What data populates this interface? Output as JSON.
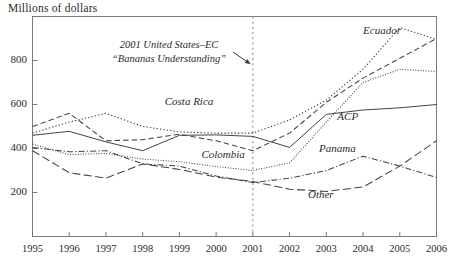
{
  "chart_data": {
    "type": "line",
    "title": "",
    "subtitle": "",
    "ylabel": "Millions of dollars",
    "xlabel": "",
    "grid": false,
    "legend_position": "inline-labels",
    "x": [
      1995,
      1996,
      1997,
      1998,
      1999,
      2000,
      2001,
      2002,
      2003,
      2004,
      2005,
      2006
    ],
    "xtick_labels": [
      "1995",
      "1996",
      "1997",
      "1998",
      "1999",
      "2000",
      "2001",
      "2002",
      "2003",
      "2004",
      "2005",
      "2006"
    ],
    "ytick_labels": [
      "200",
      "400",
      "600",
      "800"
    ],
    "ytick_values": [
      200,
      400,
      600,
      800
    ],
    "ylim": [
      0,
      1000
    ],
    "xlim": [
      1995,
      2006
    ],
    "series": [
      {
        "name": "Ecuador",
        "style": "fine-dotted",
        "label_x": 2004.0,
        "label_y": 935,
        "values": [
          420,
          372,
          378,
          352,
          340,
          318,
          300,
          335,
          520,
          700,
          760,
          750
        ]
      },
      {
        "name": "Costa Rica",
        "style": "dotted",
        "label_x": 1998.6,
        "label_y": 610,
        "values": [
          470,
          520,
          560,
          500,
          475,
          470,
          470,
          530,
          620,
          760,
          950,
          895
        ]
      },
      {
        "name": "ACP",
        "style": "solid",
        "label_x": 2003.3,
        "label_y": 545,
        "values": [
          460,
          478,
          430,
          390,
          460,
          462,
          455,
          405,
          555,
          575,
          585,
          600
        ]
      },
      {
        "name": "Colombia",
        "style": "dashed",
        "label_x": 1999.6,
        "label_y": 370,
        "values": [
          500,
          560,
          435,
          440,
          465,
          435,
          390,
          470,
          610,
          720,
          810,
          900
        ]
      },
      {
        "name": "Panama",
        "style": "dash-dot",
        "label_x": 2002.8,
        "label_y": 400,
        "values": [
          405,
          385,
          390,
          330,
          320,
          275,
          245,
          265,
          300,
          365,
          320,
          268
        ]
      },
      {
        "name": "Other",
        "style": "long-dash",
        "label_x": 2002.5,
        "label_y": 190,
        "values": [
          390,
          290,
          265,
          330,
          305,
          270,
          250,
          215,
          205,
          225,
          320,
          435
        ]
      }
    ],
    "annotations": [
      {
        "name": "bananas-understanding-note",
        "line1": "2001 United States–EC",
        "line2": "“Bananas Understanding”",
        "vline_x": 2001,
        "arrow": true
      }
    ]
  }
}
